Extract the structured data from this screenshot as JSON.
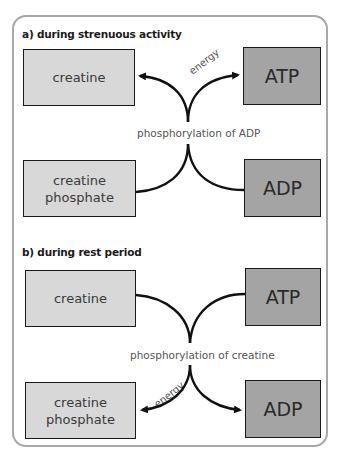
{
  "diagram": {
    "section_a": {
      "title": "a) during strenuous activity",
      "boxes": {
        "top_left": "creatine",
        "top_right": "ATP",
        "bottom_left_line1": "creatine",
        "bottom_left_line2": "phosphate",
        "bottom_right": "ADP"
      },
      "center_label": "phosphorylation of ADP",
      "arrow_label": "energy"
    },
    "section_b": {
      "title": "b) during rest period",
      "boxes": {
        "top_left": "creatine",
        "top_right": "ATP",
        "bottom_left_line1": "creatine",
        "bottom_left_line2": "phosphate",
        "bottom_right": "ADP"
      },
      "center_label": "phosphorylation of creatine",
      "arrow_label": "energy"
    },
    "colors": {
      "light_box": "#d8d8d8",
      "dark_box": "#a4a4a4",
      "frame": "#a8a8a8",
      "arrow": "#111111"
    }
  }
}
